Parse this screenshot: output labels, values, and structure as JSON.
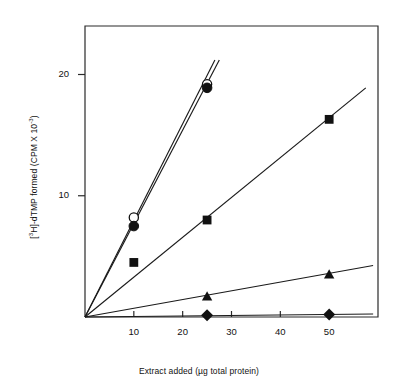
{
  "chart_data": {
    "type": "scatter",
    "title": "",
    "xlabel": "Extract added (µg total protein)",
    "ylabel": "[3H]-dTMP formed (CPM X 10-3)",
    "ylabel_parts": {
      "pre": "[",
      "sup1": "3",
      "mid": "H]-dTMP formed (CPM X 10",
      "sup2": "-3",
      "post": ")"
    },
    "xlabel_parts": {
      "pre": "Extract added (",
      "mu": "µ",
      "post": "g total protein)"
    },
    "x": [
      0,
      10,
      25,
      50
    ],
    "xlim": [
      0,
      60
    ],
    "ylim": [
      0,
      24
    ],
    "xticks": [
      10,
      20,
      30,
      40,
      50
    ],
    "xticklabels": [
      "10",
      "20",
      "30",
      "40",
      "50"
    ],
    "yticks": [
      10,
      20
    ],
    "yticklabels": [
      "10",
      "20"
    ],
    "grid": false,
    "legend": "none",
    "series": [
      {
        "name": "open-circle-series",
        "marker": "open-circle",
        "fit_slope": 0.78,
        "points": [
          {
            "x": 10,
            "y": 8.2
          },
          {
            "x": 25,
            "y": 19.2
          }
        ],
        "line_from": {
          "x": 0,
          "y": 0
        },
        "line_to": {
          "x": 26.6,
          "y": 21.2
        }
      },
      {
        "name": "filled-circle-series",
        "marker": "filled-circle",
        "fit_slope": 0.765,
        "points": [
          {
            "x": 10,
            "y": 7.5
          },
          {
            "x": 25,
            "y": 18.9
          }
        ],
        "line_from": {
          "x": 0,
          "y": 0
        },
        "line_to": {
          "x": 27.5,
          "y": 21.2
        }
      },
      {
        "name": "filled-square-series",
        "marker": "filled-square",
        "fit_slope": 0.33,
        "points": [
          {
            "x": 10,
            "y": 4.5
          },
          {
            "x": 25,
            "y": 8.0
          },
          {
            "x": 50,
            "y": 16.3
          }
        ],
        "line_from": {
          "x": 0,
          "y": 0
        },
        "line_to": {
          "x": 57.5,
          "y": 18.9
        }
      },
      {
        "name": "filled-triangle-series",
        "marker": "filled-triangle",
        "fit_slope": 0.072,
        "points": [
          {
            "x": 25,
            "y": 1.7
          },
          {
            "x": 50,
            "y": 3.5
          }
        ],
        "line_from": {
          "x": 0,
          "y": 0
        },
        "line_to": {
          "x": 59.0,
          "y": 4.25
        }
      },
      {
        "name": "filled-diamond-series",
        "marker": "filled-diamond",
        "fit_slope": 0.004,
        "points": [
          {
            "x": 25,
            "y": 0.15
          },
          {
            "x": 50,
            "y": 0.2
          }
        ],
        "line_from": {
          "x": 0,
          "y": 0
        },
        "line_to": {
          "x": 59.0,
          "y": 0.25
        }
      }
    ]
  }
}
